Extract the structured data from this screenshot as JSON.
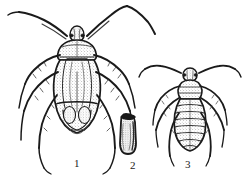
{
  "figure": {
    "background_color": "#ffffff",
    "ink_color": "#1a1a1a",
    "shade_color": "#8c8c8c",
    "width": 247,
    "height": 180,
    "labels": [
      {
        "id": "1",
        "text": "1",
        "subject": "adult-bug"
      },
      {
        "id": "2",
        "text": "2",
        "subject": "egg"
      },
      {
        "id": "3",
        "text": "3",
        "subject": "nymph"
      }
    ],
    "specimens": [
      {
        "name": "adult-bug",
        "label": "1",
        "description": "Dorsal view of adult true bug with long antennae, six legs, hemelytra with membrane venation"
      },
      {
        "name": "egg",
        "label": "2",
        "description": "Elongate oval egg with dark operculum cap at top"
      },
      {
        "name": "nymph",
        "label": "3",
        "description": "Dorsal view of nymph with striated segmented abdomen, long antennae and six legs"
      }
    ]
  }
}
